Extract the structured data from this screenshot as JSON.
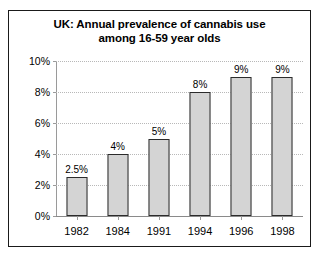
{
  "chart_data": {
    "type": "bar",
    "title": "UK: Annual prevalence of cannabis use among 16-59 year olds",
    "title_lines": [
      "UK: Annual prevalence of cannabis use",
      "among 16-59 year olds"
    ],
    "categories": [
      "1982",
      "1984",
      "1991",
      "1994",
      "1996",
      "1998"
    ],
    "values": [
      2.5,
      4,
      5,
      8,
      9,
      9
    ],
    "data_labels": [
      "2.5%",
      "4%",
      "5%",
      "8%",
      "9%",
      "9%"
    ],
    "xlabel": "",
    "ylabel": "",
    "ylim": [
      0,
      10
    ],
    "y_ticks": [
      0,
      2,
      4,
      6,
      8,
      10
    ],
    "y_tick_labels": [
      "0%",
      "2%",
      "4%",
      "6%",
      "8%",
      "10%"
    ],
    "grid": true,
    "legend": false,
    "colors": {
      "bar_fill": "#d4d4d4",
      "bar_border": "#2b2b2b",
      "gridline": "#b8b8b8",
      "axis": "#9a9a9a",
      "frame": "#1a1a1a",
      "text": "#000000",
      "background": "#ffffff"
    }
  }
}
